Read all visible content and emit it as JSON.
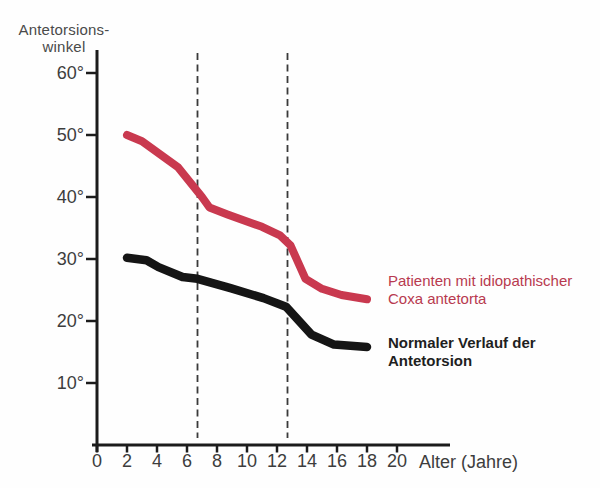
{
  "title": {
    "line1": "Antetorsions-",
    "line2": "winkel"
  },
  "x_axis_label": "Alter (Jahre)",
  "legend": {
    "red_line1": "Patienten mit idiopathischer",
    "red_line2": "Coxa antetorta",
    "black_line1": "Normaler Verlauf der",
    "black_line2": "Antetorsion"
  },
  "colors": {
    "red_series": "#c9394f",
    "black_series": "#151515",
    "axis": "#1c1c1c",
    "dashed": "#3a3a3a",
    "tick_text": "#3d3d3d",
    "legend_red": "#b83a4f",
    "legend_black": "#1f1f1f"
  },
  "chart_data": {
    "type": "line",
    "title": "",
    "xlabel": "Alter (Jahre)",
    "ylabel": "Antetorsionswinkel",
    "xlim": [
      0,
      23.5
    ],
    "ylim": [
      0,
      63.5
    ],
    "grid": false,
    "legend_position": "right",
    "x_ticks": [
      0,
      2,
      4,
      6,
      8,
      10,
      12,
      14,
      16,
      18,
      20
    ],
    "y_ticks": [
      60,
      50,
      40,
      30,
      20,
      10
    ],
    "y_tick_labels": [
      "60°",
      "50°",
      "40°",
      "30°",
      "20°",
      "10°"
    ],
    "dashed_vlines_x": [
      6.7,
      12.7
    ],
    "series": [
      {
        "name": "Patienten mit idiopathischer Coxa antetorta",
        "color": "#c9394f",
        "points": [
          [
            2,
            50
          ],
          [
            3,
            49
          ],
          [
            5.4,
            44.8
          ],
          [
            7,
            40
          ],
          [
            7.5,
            38.3
          ],
          [
            8.7,
            37.2
          ],
          [
            11,
            35.2
          ],
          [
            12.2,
            33.8
          ],
          [
            12.9,
            32.2
          ],
          [
            13.9,
            26.8
          ],
          [
            15,
            25.2
          ],
          [
            16.3,
            24.2
          ],
          [
            18,
            23.5
          ]
        ]
      },
      {
        "name": "Normaler Verlauf der Antetorsion",
        "color": "#151515",
        "points": [
          [
            2,
            30.2
          ],
          [
            3.3,
            29.8
          ],
          [
            4.1,
            28.7
          ],
          [
            5.7,
            27.1
          ],
          [
            6.7,
            26.8
          ],
          [
            8.9,
            25.3
          ],
          [
            11.1,
            23.7
          ],
          [
            12.6,
            22.3
          ],
          [
            14.3,
            17.8
          ],
          [
            15.8,
            16.2
          ],
          [
            18,
            15.8
          ]
        ]
      }
    ]
  }
}
